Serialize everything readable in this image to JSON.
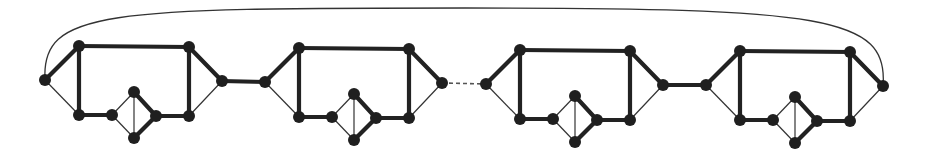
{
  "diagram": {
    "title": "",
    "colors": {
      "node": "#1f1f1f",
      "thick_edge": "#222222",
      "thin_edge": "#333333",
      "background": "#ffffff"
    },
    "node_radius": 6,
    "gadgets": [
      {
        "id": "gadget-1",
        "offset_x": 0,
        "offset_y": 0
      },
      {
        "id": "gadget-2",
        "offset_x": 220,
        "offset_y": 2
      },
      {
        "id": "gadget-3",
        "offset_x": 441,
        "offset_y": 4
      },
      {
        "id": "gadget-4",
        "offset_x": 661,
        "offset_y": 5
      }
    ],
    "gadget_template": {
      "nodes": {
        "left": [
          45,
          80
        ],
        "top_left": [
          79,
          46
        ],
        "top_right": [
          189,
          47
        ],
        "right": [
          222,
          81
        ],
        "bottom_left": [
          79,
          115
        ],
        "small_left": [
          112,
          115
        ],
        "diamond_top": [
          134,
          92
        ],
        "diamond_right": [
          156,
          116
        ],
        "diamond_bottom": [
          134,
          138
        ],
        "bottom_right": [
          189,
          116
        ]
      },
      "thick_edges": [
        [
          "left",
          "top_left"
        ],
        [
          "top_left",
          "top_right"
        ],
        [
          "top_right",
          "right"
        ],
        [
          "top_left",
          "bottom_left"
        ],
        [
          "top_right",
          "bottom_right"
        ],
        [
          "bottom_left",
          "small_left"
        ],
        [
          "diamond_top",
          "diamond_right"
        ],
        [
          "diamond_right",
          "diamond_bottom"
        ],
        [
          "diamond_right",
          "bottom_right"
        ]
      ],
      "thin_edges": [
        [
          "left",
          "bottom_left"
        ],
        [
          "right",
          "bottom_right"
        ],
        [
          "small_left",
          "diamond_top"
        ],
        [
          "small_left",
          "diamond_bottom"
        ],
        [
          "diamond_top",
          "diamond_bottom"
        ]
      ]
    },
    "connectors": [
      {
        "from": "gadget-1.right",
        "to": "gadget-2.left",
        "style": "thick"
      },
      {
        "from": "gadget-2.right",
        "to": "gadget-3.left",
        "style": "dashed"
      },
      {
        "from": "gadget-3.right",
        "to": "gadget-4.left",
        "style": "thick"
      },
      {
        "from": "gadget-1.left",
        "to": "gadget-4.right",
        "style": "arc"
      }
    ]
  }
}
